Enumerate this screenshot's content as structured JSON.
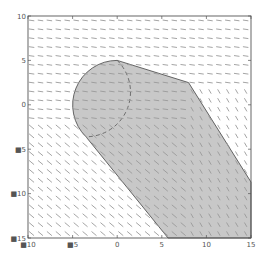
{
  "chart_data": {
    "type": "quiver",
    "title": "",
    "xlabel": "",
    "ylabel": "",
    "xlim": [
      -10,
      15
    ],
    "ylim": [
      -15,
      10
    ],
    "grid": false,
    "xticks": [
      -10,
      -5,
      0,
      5,
      10,
      15
    ],
    "yticks": [
      -15,
      -10,
      -5,
      0,
      5,
      10
    ],
    "xtick_labels": [
      "■10",
      "■5",
      "0",
      "5",
      "10",
      "15"
    ],
    "ytick_labels": [
      "■15",
      "■10",
      "■5",
      "0",
      "5",
      "10"
    ],
    "vector_field": {
      "grid_spacing": 1,
      "description": "Horizontal short arrows in upper region; diagonal down-right arrows in lower-left region; steep diagonal arrows in lower-right region",
      "color": "#9a9a9a"
    },
    "shapes": [
      {
        "name": "shaded-region",
        "type": "polygon-with-arc",
        "description": "Union of circle (center 0,0, radius 5) swept along a path to lower-right",
        "circle": {
          "cx": 0,
          "cy": 0,
          "r": 5
        },
        "outline_points": [
          [
            0,
            5
          ],
          [
            8,
            2.5
          ],
          [
            15,
            -8.7
          ],
          [
            15,
            -15
          ],
          [
            5.7,
            -15
          ],
          [
            -3.5,
            -3.6
          ]
        ],
        "fill": "#c8c8c8",
        "stroke": "#555555"
      },
      {
        "name": "dashed-arc",
        "type": "arc",
        "description": "Dashed right half of the circle drawn inside the shaded region",
        "circle": {
          "cx": 0,
          "cy": 0,
          "r": 5
        },
        "stroke": "#555555",
        "dash": "4,3"
      }
    ]
  },
  "colors": {
    "axis": "#555555",
    "fill": "#c8c8c8",
    "arrow": "#9a9a9a",
    "background": "#ffffff"
  }
}
